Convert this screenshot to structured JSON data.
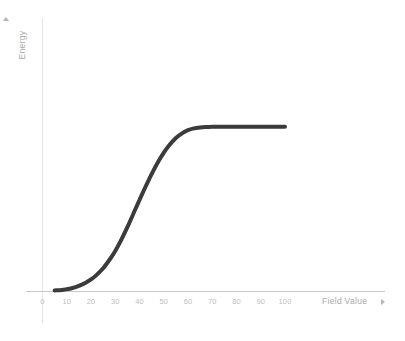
{
  "chart_data": {
    "type": "line",
    "title": "",
    "xlabel": "Field Value",
    "ylabel": "Energy",
    "xlim": [
      0,
      100
    ],
    "ylim": [
      0,
      100
    ],
    "grid": false,
    "legend": null,
    "x_ticks": [
      "0",
      "10",
      "20",
      "30",
      "40",
      "50",
      "60",
      "70",
      "80",
      "90",
      "100"
    ],
    "y_ticks": [
      "0",
      "10",
      "20",
      "30",
      "40",
      "50",
      "60",
      "70",
      "80",
      "90",
      "100"
    ],
    "series": [
      {
        "name": "Energy",
        "color": "#3b3b3b",
        "line_width": 4,
        "fade_ends": true,
        "x": [
          5,
          8,
          10,
          12,
          15,
          18,
          20,
          22,
          25,
          28,
          30,
          32,
          35,
          38,
          40,
          42,
          45,
          48,
          50,
          52,
          55,
          58,
          60,
          62,
          65,
          68,
          70,
          75,
          80,
          85,
          90,
          95,
          100
        ],
        "values": [
          0.3,
          0.5,
          0.9,
          1.4,
          2.6,
          4.3,
          5.8,
          7.7,
          11.4,
          16.3,
          20.1,
          24.5,
          32.0,
          40.2,
          45.6,
          51.0,
          58.6,
          65.4,
          69.3,
          72.7,
          76.7,
          79.4,
          80.6,
          81.4,
          82.0,
          82.2,
          82.3,
          82.3,
          82.3,
          82.3,
          82.3,
          82.3,
          82.3
        ]
      }
    ],
    "annotations": {
      "plateau_value": 82,
      "inflection_x": 45,
      "curve_shape": "sigmoid"
    }
  },
  "axes": {
    "y_title": "Energy",
    "x_title": "Field Value",
    "y_arrow_icon": "triangle-up-icon",
    "x_arrow_icon": "triangle-right-icon",
    "axis_color": "#e6e6e6",
    "tick_label_color": "#bdbdbd",
    "title_color": "#a9a9a9"
  },
  "colors": {
    "background": "#ffffff",
    "curve": "#3b3b3b"
  }
}
